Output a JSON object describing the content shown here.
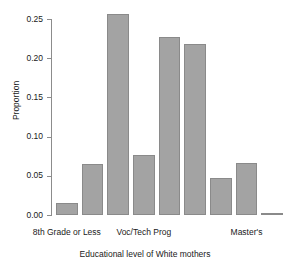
{
  "chart_data": {
    "type": "bar",
    "title": "",
    "xlabel": "Educational level of White mothers",
    "ylabel": "Proportion",
    "ylim": [
      0.0,
      0.25
    ],
    "grid": false,
    "legend": "none",
    "y_ticks": [
      "0.00",
      "0.05",
      "0.10",
      "0.15",
      "0.20",
      "0.25"
    ],
    "y_tick_values": [
      0.0,
      0.05,
      0.1,
      0.15,
      0.2,
      0.25
    ],
    "x_tick_labels": [
      "8th Grade or Less",
      "Voc/Tech Prog",
      "Master's"
    ],
    "x_tick_positions": [
      1,
      4,
      8
    ],
    "categories": [
      "1",
      "2",
      "3",
      "4",
      "5",
      "6",
      "7",
      "8",
      "9"
    ],
    "values": [
      0.015,
      0.065,
      0.256,
      0.077,
      0.227,
      0.218,
      0.047,
      0.066,
      0.001
    ],
    "bar_color": "#a3a3a3",
    "bar_edge_color": "#8a8a8a",
    "axis_color": "#8c8c8c",
    "text_color": "#1a1a1a",
    "background": "#ffffff"
  }
}
